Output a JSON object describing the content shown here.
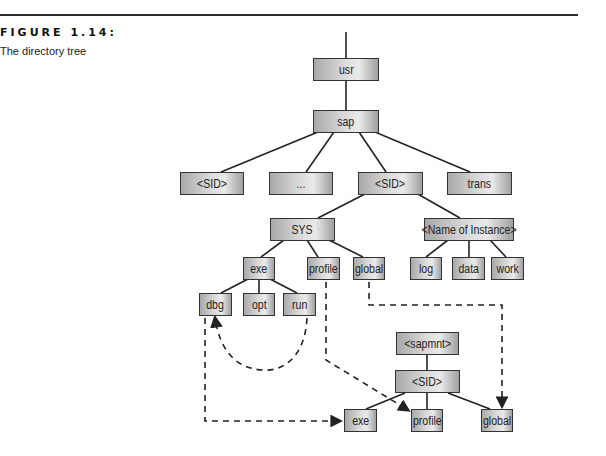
{
  "figure": {
    "label": "FIGURE 1.14:",
    "caption": "The directory tree"
  },
  "nodes": {
    "usr": "usr",
    "sap": "sap",
    "sid1": "<SID>",
    "ellipsis": "...",
    "sid2": "<SID>",
    "trans": "trans",
    "sys": "SYS",
    "instance": "<Name of Instance>",
    "exe": "exe",
    "profile": "profile",
    "global": "global",
    "log": "log",
    "data": "data",
    "work": "work",
    "dbg": "dbg",
    "opt": "opt",
    "run": "run",
    "sapmnt": "<sapmnt>",
    "sid3": "<SID>",
    "exe2": "exe",
    "profile2": "profile",
    "global2": "global"
  },
  "links": {
    "solid": [
      [
        "usr",
        "sap"
      ],
      [
        "sap",
        "sid1"
      ],
      [
        "sap",
        "ellipsis"
      ],
      [
        "sap",
        "sid2"
      ],
      [
        "sap",
        "trans"
      ],
      [
        "sid2",
        "sys"
      ],
      [
        "sid2",
        "instance"
      ],
      [
        "sys",
        "exe"
      ],
      [
        "sys",
        "profile"
      ],
      [
        "sys",
        "global"
      ],
      [
        "instance",
        "log"
      ],
      [
        "instance",
        "data"
      ],
      [
        "instance",
        "work"
      ],
      [
        "exe",
        "dbg"
      ],
      [
        "exe",
        "opt"
      ],
      [
        "exe",
        "run"
      ],
      [
        "sapmnt",
        "sid3"
      ],
      [
        "sid3",
        "exe2"
      ],
      [
        "sid3",
        "profile2"
      ],
      [
        "sid3",
        "global2"
      ]
    ],
    "dashed": [
      [
        "run",
        "dbg"
      ],
      [
        "dbg",
        "exe2"
      ],
      [
        "profile",
        "profile2"
      ],
      [
        "global",
        "global2"
      ]
    ]
  }
}
